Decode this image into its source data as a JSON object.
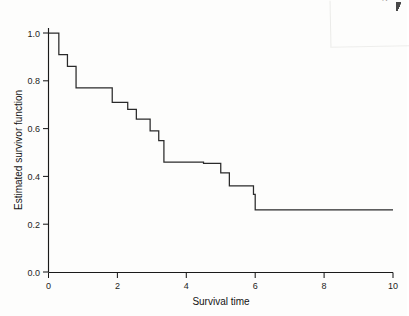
{
  "figure": {
    "background_color": "#fdfdfc",
    "line_color": "#2a2a2a",
    "axis_color": "#1a1a1a",
    "corner_page_number": "2"
  },
  "chart_data": {
    "type": "line",
    "subtype": "kaplan-meier-step",
    "title": "",
    "xlabel": "Survival time",
    "ylabel": "Estimated survivor function",
    "xlim": [
      0,
      10
    ],
    "ylim": [
      0.0,
      1.0
    ],
    "xticks": [
      0,
      2,
      4,
      6,
      8,
      10
    ],
    "xticklabels": [
      "0",
      "2",
      "4",
      "6",
      "8",
      "10"
    ],
    "yticks": [
      0.0,
      0.2,
      0.4,
      0.6,
      0.8,
      1.0
    ],
    "yticklabels": [
      "0.0",
      "0.2",
      "0.4",
      "0.6",
      "0.8",
      "1.0"
    ],
    "grid": false,
    "legend": false,
    "legend_position": "none",
    "series": [
      {
        "name": "Estimated survivor function",
        "step": "post",
        "x": [
          0.0,
          0.3,
          0.55,
          0.8,
          1.85,
          2.3,
          2.55,
          2.95,
          3.2,
          3.35,
          4.5,
          5.0,
          5.25,
          5.95,
          10.0
        ],
        "y": [
          1.0,
          0.91,
          0.86,
          0.77,
          0.71,
          0.68,
          0.64,
          0.59,
          0.55,
          0.46,
          0.455,
          0.415,
          0.36,
          0.325,
          0.26
        ]
      }
    ],
    "steps": [
      {
        "time": 0.0,
        "survival": 1.0
      },
      {
        "time": 0.3,
        "survival": 0.91
      },
      {
        "time": 0.55,
        "survival": 0.86
      },
      {
        "time": 0.8,
        "survival": 0.77
      },
      {
        "time": 1.85,
        "survival": 0.71
      },
      {
        "time": 2.3,
        "survival": 0.68
      },
      {
        "time": 2.55,
        "survival": 0.64
      },
      {
        "time": 2.95,
        "survival": 0.59
      },
      {
        "time": 3.2,
        "survival": 0.55
      },
      {
        "time": 3.35,
        "survival": 0.46
      },
      {
        "time": 4.5,
        "survival": 0.455
      },
      {
        "time": 5.0,
        "survival": 0.415
      },
      {
        "time": 5.25,
        "survival": 0.36
      },
      {
        "time": 5.95,
        "survival": 0.325
      },
      {
        "time": 6.0,
        "survival": 0.26
      },
      {
        "time": 10.0,
        "survival": 0.26
      }
    ]
  }
}
